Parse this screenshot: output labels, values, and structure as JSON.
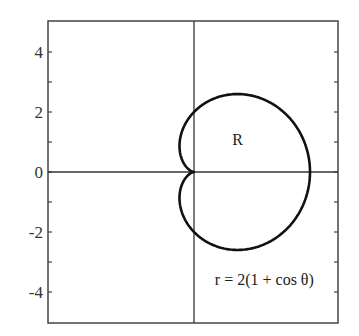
{
  "chart_data": {
    "type": "line",
    "title": "",
    "xlabel": "",
    "ylabel": "",
    "xlim": [
      -5,
      5
    ],
    "ylim": [
      -5,
      5
    ],
    "grid": false,
    "legend": null,
    "y_ticks": [
      4,
      2,
      0,
      -2,
      -4
    ],
    "y_tick_labels": [
      "4",
      "2",
      "0",
      "-2",
      "-4"
    ],
    "y_minor_ticks": [
      3,
      1,
      -1,
      -3
    ],
    "x_ticks": [],
    "axes_lines": {
      "x_axis_at_y": 0,
      "y_axis_at_x": 0
    },
    "series": [
      {
        "name": "cardioid",
        "equation": "r = 2(1 + cos θ)",
        "polar": true,
        "a": 2,
        "theta_range": [
          0,
          6.283185
        ],
        "sample_points": [
          {
            "theta_deg": 0,
            "x": 4.0,
            "y": 0.0
          },
          {
            "theta_deg": 60,
            "x": 1.5,
            "y": 2.598
          },
          {
            "theta_deg": 90,
            "x": 0.0,
            "y": 2.0
          },
          {
            "theta_deg": 120,
            "x": -0.5,
            "y": 0.866
          },
          {
            "theta_deg": 180,
            "x": 0.0,
            "y": 0.0
          },
          {
            "theta_deg": 240,
            "x": -0.5,
            "y": -0.866
          },
          {
            "theta_deg": 270,
            "x": 0.0,
            "y": -2.0
          },
          {
            "theta_deg": 300,
            "x": 1.5,
            "y": -2.598
          }
        ]
      }
    ],
    "annotations": [
      {
        "text": "R",
        "x": 1.5,
        "y": 1.1
      },
      {
        "text": "r = 2(1 + cos θ)",
        "x": 2.15,
        "y": -3.55
      }
    ]
  },
  "labels": {
    "region": "R",
    "equation": "r = 2(1 + cos θ)",
    "ticks": [
      "4",
      "2",
      "0",
      "-2",
      "-4"
    ]
  },
  "colors": {
    "curve": "#111111",
    "frame": "#444444",
    "axes": "#333333",
    "text": "#222222"
  }
}
